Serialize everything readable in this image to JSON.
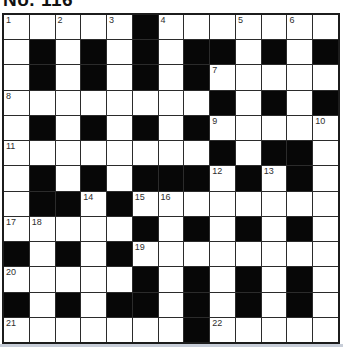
{
  "title": "No. 116",
  "grid": {
    "size": 13,
    "rows": [
      ".....#.......",
      ".#.#.#.##.#.#",
      ".#.#.#.#.....",
      "........#.#.#",
      ".#.#.#.#.....",
      "........#.##.",
      ".#.#.###.#.#.",
      ".##.#........",
      ".....#.#.#.#.",
      "#.#.#........",
      ".....#.#.#.#.",
      "#.#.##.#.#.#.",
      ".......#....."
    ],
    "numbers": {
      "1,1": "1",
      "1,3": "2",
      "1,5": "3",
      "1,7": "4",
      "1,10": "5",
      "1,12": "6",
      "3,9": "7",
      "4,1": "8",
      "5,9": "9",
      "5,13": "10",
      "6,1": "11",
      "7,9": "12",
      "7,11": "13",
      "8,4": "14",
      "8,6": "15",
      "8,7": "16",
      "9,1": "17",
      "9,2": "18",
      "10,6": "19",
      "11,1": "20",
      "13,1": "21",
      "13,9": "22"
    },
    "colors": {
      "black_cell": "#070707",
      "white_cell": "#ffffff",
      "grid_line": "#2b2b2b",
      "number_text": "#2e2e2e"
    }
  }
}
